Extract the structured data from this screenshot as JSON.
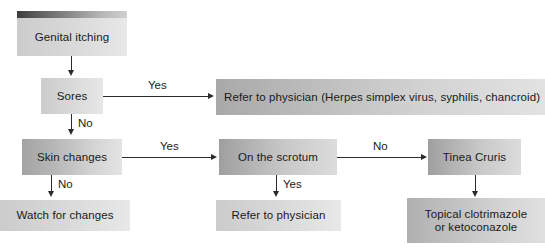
{
  "diagram": {
    "colors": {
      "text": "#1a1a1a",
      "edge": "#2b2b2b",
      "node_fill_dark": "#a9a9a9",
      "node_fill_light": "#e4e4e4",
      "header_bar_dark": "#3d3d3d",
      "header_bar_light": "#cfcfcf",
      "background": "#ffffff"
    },
    "nodes": [
      {
        "id": "genital-itching",
        "label": "Genital itching"
      },
      {
        "id": "sores",
        "label": "Sores"
      },
      {
        "id": "refer-herpes",
        "label": "Refer to physician (Herpes simplex virus, syphilis, chancroid)"
      },
      {
        "id": "skin-changes",
        "label": "Skin changes"
      },
      {
        "id": "on-the-scrotum",
        "label": "On the scrotum"
      },
      {
        "id": "tinea-cruris",
        "label": "Tinea Cruris"
      },
      {
        "id": "watch-for-changes",
        "label": "Watch for changes"
      },
      {
        "id": "refer-to-physician",
        "label": "Refer to physician"
      },
      {
        "id": "topical-treatment",
        "label": "Topical clotrimazole\nor ketoconazole"
      }
    ],
    "edges": [
      {
        "id": "itching-to-sores",
        "from": "genital-itching",
        "to": "sores",
        "label": ""
      },
      {
        "id": "sores-yes",
        "from": "sores",
        "to": "refer-herpes",
        "label": "Yes"
      },
      {
        "id": "sores-no",
        "from": "sores",
        "to": "skin-changes",
        "label": "No"
      },
      {
        "id": "skin-yes",
        "from": "skin-changes",
        "to": "on-the-scrotum",
        "label": "Yes"
      },
      {
        "id": "skin-no",
        "from": "skin-changes",
        "to": "watch-for-changes",
        "label": "No"
      },
      {
        "id": "scrotum-no",
        "from": "on-the-scrotum",
        "to": "tinea-cruris",
        "label": "No"
      },
      {
        "id": "scrotum-yes",
        "from": "on-the-scrotum",
        "to": "refer-to-physician",
        "label": "Yes"
      },
      {
        "id": "tinea-to-topical",
        "from": "tinea-cruris",
        "to": "topical-treatment",
        "label": ""
      }
    ]
  }
}
